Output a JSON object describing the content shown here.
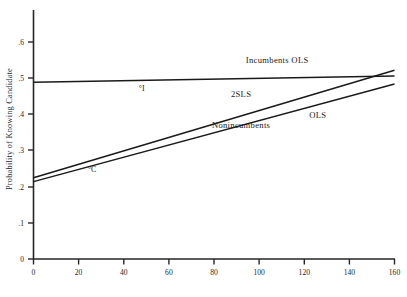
{
  "chart_data": {
    "type": "line",
    "title": "",
    "xlabel": "",
    "ylabel": "Probability of Knowing Candidate",
    "xlim": [
      0,
      160
    ],
    "ylim": [
      0,
      0.65
    ],
    "xticks": [
      0,
      20,
      40,
      60,
      80,
      100,
      120,
      140,
      160
    ],
    "xticklabels": [
      "0",
      "20",
      "40",
      "60",
      "80",
      "100",
      "120",
      "140",
      "160"
    ],
    "yticks": [
      0,
      0.1,
      0.2,
      0.3,
      0.4,
      0.5,
      0.6
    ],
    "yticklabels": [
      "0",
      ".1",
      ".2",
      ".3",
      ".4",
      ".5",
      ".6"
    ],
    "grid": false,
    "legend_position": "inline-annotations",
    "series": [
      {
        "name": "Incumbents OLS",
        "label": "Incumbents  OLS",
        "x": [
          0,
          160
        ],
        "values": [
          0.489,
          0.506
        ],
        "label_x": 108,
        "label_y": 0.542,
        "color": "#1a1a1a"
      },
      {
        "name": "2SLS",
        "label": "2SLS",
        "x": [
          0,
          160
        ],
        "values": [
          0.225,
          0.522
        ],
        "label_x": 92,
        "label_y": 0.447,
        "color": "#1a1a1a"
      },
      {
        "name": "OLS Nonincumbents",
        "label": "OLS",
        "sublabel": "Nonincumbents",
        "x": [
          0,
          160
        ],
        "values": [
          0.214,
          0.484
        ],
        "label_x": 126,
        "label_y": 0.39,
        "sublabel_x": 92,
        "sublabel_y": 0.362,
        "color": "#1a1a1a"
      }
    ],
    "annotations": [
      {
        "text": "°I",
        "x": 48,
        "y": 0.465,
        "name": "incumbent-mean-point"
      },
      {
        "text": "°C",
        "x": 26,
        "y": 0.24,
        "name": "challenger-mean-point"
      }
    ]
  }
}
